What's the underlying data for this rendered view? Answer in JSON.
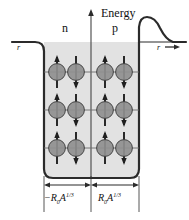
{
  "figure": {
    "background_color": "#ffffff",
    "well_fill_color": "#e0e0e0",
    "line_color": "#2b2b2b",
    "nucleon_fill_color": "#8c8c8c",
    "nucleon_stroke_color": "#3a3a3a",
    "level_line_color": "#6f6f6f"
  },
  "axes": {
    "energy_label": "Energy",
    "energy_axis_name": "vertical-energy-axis",
    "r_label_left": "r",
    "r_label_right": "r",
    "r_arrow_glyph": "→"
  },
  "regions": {
    "left_label": "n",
    "left_name": "neutron-well-region",
    "right_label": "p",
    "right_name": "proton-well-region"
  },
  "dimensions": {
    "left_label_prefix": "−R",
    "left_sub": "0",
    "left_var": "A",
    "left_sup": "1/3",
    "right_label_prefix": "R",
    "right_sub": "0",
    "right_var": "A",
    "right_sup": "1/3",
    "left_full": "−R0A^1/3",
    "right_full": "R0A^1/3"
  },
  "energy_levels": [
    {
      "index": 1,
      "y": 72,
      "left_spins": [
        "up",
        "down"
      ],
      "right_spins": [
        "up",
        "down"
      ]
    },
    {
      "index": 2,
      "y": 110,
      "left_spins": [
        "up",
        "down"
      ],
      "right_spins": [
        "up",
        "down"
      ]
    },
    {
      "index": 3,
      "y": 148,
      "left_spins": [
        "up",
        "down"
      ],
      "right_spins": [
        "up",
        "down"
      ]
    }
  ],
  "nucleon_columns": {
    "left_x": [
      57,
      76
    ],
    "right_x": [
      105,
      124
    ]
  },
  "well": {
    "left_wall_x": 44,
    "right_wall_x": 139,
    "top_y": 42,
    "bottom_y": 178,
    "corner_radius": 9
  },
  "coulomb_barrier": {
    "present": true,
    "peak_x": 147,
    "peak_y": 17,
    "name": "coulomb-barrier-curve"
  }
}
